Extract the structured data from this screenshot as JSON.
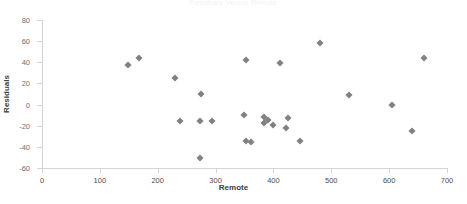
{
  "chart": {
    "title": "Residuals Versus Remote",
    "xlabel": "Remote",
    "ylabel": "Residuals",
    "marker_color": "#808085",
    "axis_color": "#d4d4d6"
  },
  "chart_data": {
    "type": "scatter",
    "title": "Residuals Versus Remote",
    "xlabel": "Remote",
    "ylabel": "Residuals",
    "xlim": [
      0,
      700
    ],
    "ylim": [
      -60,
      80
    ],
    "xticks": [
      0,
      100,
      200,
      300,
      400,
      500,
      600,
      700
    ],
    "yticks": [
      -60,
      -40,
      -20,
      0,
      20,
      40,
      60,
      80
    ],
    "grid": false,
    "legend": null,
    "series": [
      {
        "name": "Residuals",
        "points": [
          {
            "x": 149,
            "y": 37
          },
          {
            "x": 168,
            "y": 44
          },
          {
            "x": 230,
            "y": 25
          },
          {
            "x": 275,
            "y": 10
          },
          {
            "x": 238,
            "y": -16
          },
          {
            "x": 273,
            "y": -16
          },
          {
            "x": 294,
            "y": -16
          },
          {
            "x": 273,
            "y": -51
          },
          {
            "x": 349,
            "y": -10
          },
          {
            "x": 352,
            "y": -34
          },
          {
            "x": 361,
            "y": -35
          },
          {
            "x": 383,
            "y": -17
          },
          {
            "x": 390,
            "y": -15
          },
          {
            "x": 384,
            "y": -12
          },
          {
            "x": 399,
            "y": -19
          },
          {
            "x": 425,
            "y": -13
          },
          {
            "x": 421,
            "y": -22
          },
          {
            "x": 446,
            "y": -34
          },
          {
            "x": 353,
            "y": 42
          },
          {
            "x": 412,
            "y": 39
          },
          {
            "x": 480,
            "y": 58
          },
          {
            "x": 531,
            "y": 9
          },
          {
            "x": 605,
            "y": 0
          },
          {
            "x": 639,
            "y": -25
          },
          {
            "x": 661,
            "y": 44
          }
        ]
      }
    ]
  }
}
